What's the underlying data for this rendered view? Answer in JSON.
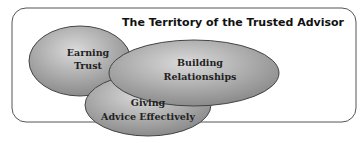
{
  "diagram": {
    "title": "The Territory of the Trusted Advisor",
    "circles": [
      {
        "line1": "Earning",
        "line2": "Trust"
      },
      {
        "line1": "Building",
        "line2": "Relationships"
      },
      {
        "line1": "Giving",
        "line2": "Advice Effectively"
      }
    ],
    "colors": {
      "ellipse_light": "#cfcfcf",
      "ellipse_dark": "#8a8a8a",
      "border": "#555555"
    }
  }
}
